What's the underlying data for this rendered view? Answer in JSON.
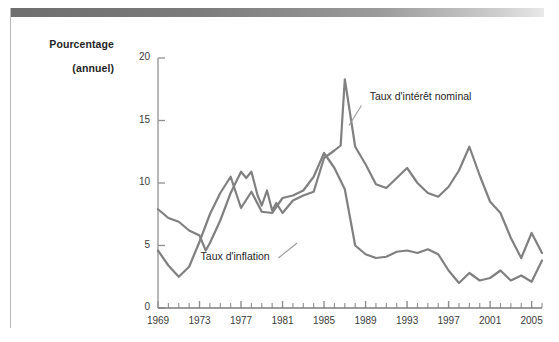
{
  "page": {
    "background_color": "#ffffff",
    "rule_color": "#b9b9b9",
    "header_bar_color": "#6e6e6e"
  },
  "chart_data": {
    "type": "line",
    "title": "",
    "subtitle": "",
    "ylabel": "Pourcentage (annuel)",
    "ylabel_line1": "Pourcentage",
    "ylabel_line2": "(annuel)",
    "xlabel": "",
    "ylim": [
      0,
      20
    ],
    "yticks": [
      0,
      5,
      10,
      15,
      20
    ],
    "ytick_labels": [
      "0",
      "5",
      "10",
      "15",
      "20"
    ],
    "xlim": [
      1969,
      2006
    ],
    "xticks": [
      1969,
      1973,
      1977,
      1981,
      1985,
      1989,
      1993,
      1997,
      2001,
      2005
    ],
    "xtick_labels": [
      "1969",
      "1973",
      "1977",
      "1981",
      "1985",
      "1989",
      "1993",
      "1997",
      "2001",
      "2005"
    ],
    "xtick_minor_every": 1,
    "grid": false,
    "legend": "annotations",
    "legend_position": "inline-annotations",
    "line_color": "#808080",
    "line_width": 2.2,
    "x": [
      1969,
      1970,
      1971,
      1972,
      1973,
      1974,
      1975,
      1976,
      1977,
      1978,
      1979,
      1980,
      1981,
      1982,
      1983,
      1984,
      1985,
      1986,
      1987,
      1988,
      1989,
      1990,
      1991,
      1992,
      1993,
      1994,
      1995,
      1996,
      1997,
      1998,
      1999,
      2000,
      2001,
      2002,
      2003,
      2004,
      2005,
      2006
    ],
    "series": [
      {
        "name": "Taux d'intérêt nominal",
        "annotation": "Taux d'intérêt nominal",
        "color": "#808080",
        "values": [
          7.9,
          7.6,
          6.4,
          6.0,
          7.0,
          7.9,
          6.1,
          5.3,
          5.4,
          7.3,
          9.2,
          11.5,
          13.9,
          11.0,
          8.6,
          9.5,
          7.5,
          6.0,
          5.8,
          6.7,
          8.1,
          7.5,
          5.4,
          3.4,
          3.0,
          4.3,
          5.5,
          5.0,
          5.1,
          4.8,
          4.7,
          5.8,
          3.4,
          1.6,
          1.0,
          1.4,
          3.2,
          4.7
        ]
      },
      {
        "name": "Taux d'inflation",
        "annotation": "Taux d'inflation",
        "color": "#808080",
        "values": [
          4.6,
          3.4,
          2.5,
          3.3,
          6.2,
          11.0,
          9.1,
          5.8,
          6.5,
          7.6,
          11.3,
          13.5,
          10.3,
          6.2,
          3.2,
          4.3,
          3.6,
          1.9,
          3.6,
          4.1,
          4.8,
          5.4,
          4.2,
          3.0,
          3.0,
          2.6,
          2.8,
          3.0,
          2.3,
          1.6,
          2.2,
          3.4,
          2.8,
          1.6,
          2.3,
          2.7,
          3.4,
          2.5
        ]
      }
    ],
    "series_nominal_points": [
      [
        1969,
        7.9
      ],
      [
        1970,
        7.6
      ],
      [
        1971,
        6.4
      ],
      [
        1972,
        6.0
      ],
      [
        1973,
        7.0
      ],
      [
        1974,
        7.9
      ],
      [
        1975,
        6.1
      ],
      [
        1976,
        5.3
      ],
      [
        1977,
        5.4
      ],
      [
        1978,
        7.3
      ],
      [
        1979,
        9.2
      ],
      [
        1980,
        11.5
      ],
      [
        1981,
        13.9
      ],
      [
        1982,
        11.0
      ],
      [
        1983,
        8.6
      ],
      [
        1984,
        9.5
      ],
      [
        1985,
        7.5
      ],
      [
        1986,
        6.0
      ],
      [
        1987,
        5.8
      ],
      [
        1988,
        6.7
      ],
      [
        1989,
        8.1
      ],
      [
        1990,
        7.5
      ],
      [
        1991,
        5.4
      ],
      [
        1992,
        3.4
      ],
      [
        1993,
        3.0
      ],
      [
        1994,
        4.3
      ],
      [
        1995,
        5.5
      ],
      [
        1996,
        5.0
      ],
      [
        1997,
        5.1
      ],
      [
        1998,
        4.8
      ],
      [
        1999,
        4.7
      ],
      [
        2000,
        5.8
      ],
      [
        2001,
        3.4
      ],
      [
        2002,
        1.6
      ],
      [
        2003,
        1.0
      ],
      [
        2004,
        1.4
      ],
      [
        2005,
        3.2
      ],
      [
        2006,
        4.7
      ]
    ],
    "annotations": [
      {
        "text": "Taux d'intérêt nominal",
        "x": 1984.2,
        "y": 16.6
      },
      {
        "text": "Taux d'inflation",
        "x": 1975.0,
        "y": 3.9
      }
    ]
  },
  "chart_curves": {
    "nominal": [
      [
        1969,
        7.9
      ],
      [
        1970,
        7.2
      ],
      [
        1971,
        6.9
      ],
      [
        1972,
        6.2
      ],
      [
        1973,
        5.8
      ],
      [
        1973.6,
        4.6
      ],
      [
        1974,
        5.2
      ],
      [
        1975,
        7.0
      ],
      [
        1976,
        9.2
      ],
      [
        1977,
        10.9
      ],
      [
        1977.5,
        10.4
      ],
      [
        1978,
        10.9
      ],
      [
        1978.6,
        9.0
      ],
      [
        1979,
        8.2
      ],
      [
        1979.5,
        9.4
      ],
      [
        1980,
        7.8
      ],
      [
        1980.4,
        8.4
      ],
      [
        1981,
        7.6
      ],
      [
        1981.4,
        8.0
      ],
      [
        1982,
        8.6
      ],
      [
        1983,
        9.0
      ],
      [
        1984,
        9.3
      ],
      [
        1985,
        12.0
      ],
      [
        1986,
        12.6
      ],
      [
        1986.6,
        13.0
      ],
      [
        1987,
        18.3
      ],
      [
        1988,
        12.9
      ],
      [
        1989,
        11.5
      ],
      [
        1990,
        9.9
      ],
      [
        1991,
        9.6
      ],
      [
        1992,
        10.4
      ],
      [
        1993,
        11.2
      ],
      [
        1994,
        10.0
      ],
      [
        1995,
        9.2
      ],
      [
        1996,
        8.9
      ],
      [
        1997,
        9.7
      ],
      [
        1998,
        11.0
      ],
      [
        1999,
        12.9
      ],
      [
        2000,
        10.6
      ],
      [
        2001,
        8.5
      ],
      [
        2002,
        7.6
      ],
      [
        2003,
        5.6
      ],
      [
        2004,
        4.0
      ],
      [
        2005,
        6.0
      ],
      [
        2006,
        4.4
      ]
    ],
    "inflation": [
      [
        1969,
        4.6
      ],
      [
        1970,
        3.4
      ],
      [
        1971,
        2.5
      ],
      [
        1972,
        3.3
      ],
      [
        1973,
        5.3
      ],
      [
        1974,
        7.5
      ],
      [
        1975,
        9.2
      ],
      [
        1976,
        10.5
      ],
      [
        1977,
        8.0
      ],
      [
        1978,
        9.3
      ],
      [
        1979,
        7.7
      ],
      [
        1980,
        7.6
      ],
      [
        1981,
        8.8
      ],
      [
        1982,
        9.0
      ],
      [
        1983,
        9.4
      ],
      [
        1984,
        10.5
      ],
      [
        1985,
        12.4
      ],
      [
        1986,
        11.2
      ],
      [
        1987,
        9.5
      ],
      [
        1988,
        5.0
      ],
      [
        1989,
        4.3
      ],
      [
        1990,
        4.0
      ],
      [
        1991,
        4.1
      ],
      [
        1992,
        4.5
      ],
      [
        1993,
        4.6
      ],
      [
        1994,
        4.4
      ],
      [
        1995,
        4.7
      ],
      [
        1996,
        4.3
      ],
      [
        1997,
        3.0
      ],
      [
        1998,
        2.0
      ],
      [
        1999,
        2.8
      ],
      [
        2000,
        2.2
      ],
      [
        2001,
        2.4
      ],
      [
        2002,
        3.0
      ],
      [
        2003,
        2.2
      ],
      [
        2004,
        2.6
      ],
      [
        2005,
        2.1
      ],
      [
        2006,
        3.8
      ]
    ]
  }
}
